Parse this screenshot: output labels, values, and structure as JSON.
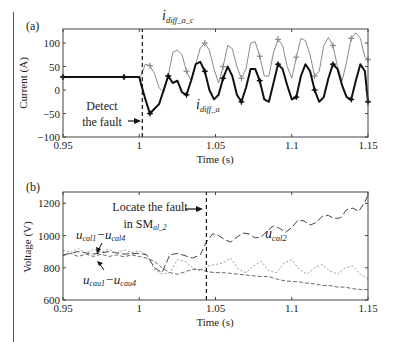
{
  "chart_data": [
    {
      "type": "line",
      "panel_label": "(a)",
      "title": "",
      "xlabel": "Time (s)",
      "ylabel": "Current (A)",
      "xlim": [
        0.95,
        1.15
      ],
      "ylim": [
        -100,
        130
      ],
      "xticks": [
        0.95,
        1,
        1.05,
        1.1,
        1.15
      ],
      "xtick_labels": [
        "0.95",
        "1",
        "1.05",
        "1.1",
        "1.15"
      ],
      "yticks": [
        -100,
        -50,
        0,
        50,
        100
      ],
      "ytick_labels": [
        "−100",
        "−50",
        "0",
        "50",
        "100"
      ],
      "grid": false,
      "vline": {
        "x": 1.002,
        "style": "dashed"
      },
      "annotations": [
        {
          "text": "Detect",
          "x": 0.965,
          "y": -30
        },
        {
          "text": "the fault",
          "x": 0.965,
          "y": -62,
          "arrow_to": [
            1.001,
            -55
          ]
        },
        {
          "text": "i",
          "sub": "diff_a_c",
          "x": 1.026,
          "y": 105
        },
        {
          "text": "i",
          "sub": "diff_a",
          "x": 1.045,
          "y": -72
        }
      ],
      "series": [
        {
          "name": "i_diff_a_c",
          "color": "#8a8a8a",
          "marker": "+",
          "x": [
            0.95,
            0.96,
            0.97,
            0.98,
            0.99,
            1.0,
            1.001,
            1.004,
            1.007,
            1.01,
            1.013,
            1.016,
            1.019,
            1.022,
            1.025,
            1.028,
            1.031,
            1.034,
            1.037,
            1.04,
            1.043,
            1.046,
            1.049,
            1.052,
            1.055,
            1.058,
            1.061,
            1.064,
            1.067,
            1.07,
            1.073,
            1.076,
            1.079,
            1.082,
            1.085,
            1.088,
            1.091,
            1.094,
            1.097,
            1.1,
            1.103,
            1.106,
            1.109,
            1.112,
            1.115,
            1.118,
            1.121,
            1.124,
            1.127,
            1.13,
            1.133,
            1.136,
            1.139,
            1.142,
            1.145,
            1.148,
            1.15
          ],
          "y": [
            28,
            28,
            28,
            28,
            28,
            28,
            30,
            55,
            52,
            35,
            5,
            -5,
            30,
            80,
            85,
            75,
            40,
            20,
            55,
            90,
            100,
            85,
            45,
            15,
            50,
            95,
            88,
            50,
            25,
            45,
            100,
            103,
            72,
            30,
            30,
            80,
            108,
            95,
            50,
            25,
            70,
            110,
            105,
            75,
            30,
            40,
            95,
            112,
            95,
            50,
            20,
            60,
            110,
            122,
            110,
            70,
            65
          ]
        },
        {
          "name": "i_diff_a",
          "color": "#111111",
          "marker": "*",
          "x": [
            0.95,
            0.96,
            0.97,
            0.98,
            0.99,
            1.0,
            1.001,
            1.004,
            1.007,
            1.01,
            1.013,
            1.016,
            1.019,
            1.022,
            1.025,
            1.028,
            1.031,
            1.034,
            1.037,
            1.04,
            1.043,
            1.046,
            1.049,
            1.052,
            1.055,
            1.058,
            1.061,
            1.064,
            1.067,
            1.07,
            1.073,
            1.076,
            1.079,
            1.082,
            1.085,
            1.088,
            1.091,
            1.094,
            1.097,
            1.1,
            1.103,
            1.106,
            1.109,
            1.112,
            1.115,
            1.118,
            1.121,
            1.124,
            1.127,
            1.13,
            1.133,
            1.136,
            1.139,
            1.142,
            1.145,
            1.148,
            1.15
          ],
          "y": [
            28,
            28,
            28,
            28,
            28,
            28,
            15,
            -20,
            -50,
            -40,
            -30,
            0,
            30,
            15,
            20,
            -5,
            -10,
            20,
            55,
            60,
            40,
            0,
            -20,
            -10,
            25,
            50,
            30,
            -10,
            -25,
            5,
            45,
            45,
            20,
            -20,
            -25,
            15,
            55,
            45,
            10,
            -20,
            -15,
            30,
            55,
            40,
            0,
            -25,
            -15,
            25,
            55,
            45,
            10,
            -15,
            -20,
            20,
            55,
            40,
            -25
          ]
        },
        {
          "name": "dashed_fault_line",
          "color": "#111111",
          "x": [
            1.002,
            1.002
          ],
          "y": [
            -100,
            130
          ]
        }
      ]
    },
    {
      "type": "line",
      "panel_label": "(b)",
      "title": "",
      "xlabel": "Time (s)",
      "ylabel": "Voltage (V)",
      "xlim": [
        0.95,
        1.15
      ],
      "ylim": [
        600,
        1270
      ],
      "xticks": [
        0.95,
        1,
        1.05,
        1.1,
        1.15
      ],
      "xtick_labels": [
        "0.95",
        "1",
        "1.05",
        "1.1",
        "1.15"
      ],
      "yticks": [
        600,
        800,
        1000,
        1200
      ],
      "ytick_labels": [
        "600",
        "800",
        "1000",
        "1200"
      ],
      "grid": false,
      "vline": {
        "x": 1.044,
        "style": "dashed"
      },
      "annotations": [
        {
          "text": "Locate the fault",
          "x": 0.99,
          "y": 1200
        },
        {
          "text": "in SM",
          "sub": "al_2",
          "x": 1.0,
          "y": 1120,
          "arrow_to": [
            1.043,
            1175
          ]
        },
        {
          "text": "u",
          "sub": "cal1",
          "text2": "−u",
          "sub2": "cal4",
          "x": 0.957,
          "y": 970,
          "arrow_to": [
            0.975,
            920
          ]
        },
        {
          "text": "u",
          "sub": "cau1",
          "text2": "−u",
          "sub2": "cau4",
          "x": 0.962,
          "y": 735,
          "arrow_to": [
            0.973,
            860
          ]
        },
        {
          "text": "u",
          "sub": "cal2",
          "x": 1.09,
          "y": 1140
        }
      ],
      "series": [
        {
          "name": "u_cal2",
          "color": "#444444",
          "style": "dashdot",
          "x": [
            0.95,
            0.96,
            0.97,
            0.98,
            0.99,
            1.0,
            1.005,
            1.01,
            1.015,
            1.02,
            1.025,
            1.03,
            1.035,
            1.04,
            1.044,
            1.048,
            1.052,
            1.056,
            1.06,
            1.064,
            1.068,
            1.072,
            1.076,
            1.08,
            1.084,
            1.088,
            1.092,
            1.096,
            1.1,
            1.104,
            1.108,
            1.112,
            1.116,
            1.12,
            1.124,
            1.128,
            1.132,
            1.136,
            1.14,
            1.144,
            1.148,
            1.15
          ],
          "y": [
            880,
            900,
            885,
            900,
            885,
            890,
            880,
            800,
            770,
            880,
            890,
            875,
            860,
            880,
            960,
            1010,
            1000,
            975,
            960,
            990,
            1015,
            1010,
            985,
            990,
            1030,
            1060,
            1045,
            1020,
            1050,
            1095,
            1090,
            1065,
            1080,
            1120,
            1125,
            1105,
            1110,
            1160,
            1170,
            1150,
            1210,
            1250
          ]
        },
        {
          "name": "u_cal1-u_cal4",
          "color": "#9a9a9a",
          "style": "dotted",
          "x": [
            0.95,
            0.955,
            0.96,
            0.965,
            0.97,
            0.975,
            0.98,
            0.985,
            0.99,
            0.995,
            1.0,
            1.005,
            1.01,
            1.015,
            1.02,
            1.025,
            1.03,
            1.035,
            1.04,
            1.045,
            1.05,
            1.055,
            1.06,
            1.065,
            1.07,
            1.075,
            1.08,
            1.085,
            1.09,
            1.095,
            1.1,
            1.105,
            1.11,
            1.115,
            1.12,
            1.125,
            1.13,
            1.135,
            1.14,
            1.145,
            1.15
          ],
          "y": [
            910,
            895,
            920,
            890,
            915,
            895,
            915,
            890,
            910,
            895,
            905,
            880,
            790,
            760,
            770,
            850,
            840,
            800,
            780,
            810,
            820,
            830,
            860,
            790,
            770,
            810,
            840,
            780,
            770,
            830,
            850,
            790,
            760,
            800,
            820,
            780,
            760,
            800,
            810,
            760,
            730
          ]
        },
        {
          "name": "u_cau1-u_cau4",
          "color": "#6a6a6a",
          "style": "dashed",
          "x": [
            0.95,
            0.955,
            0.96,
            0.965,
            0.97,
            0.975,
            0.98,
            0.985,
            0.99,
            0.995,
            1.0,
            1.005,
            1.01,
            1.015,
            1.02,
            1.025,
            1.03,
            1.035,
            1.04,
            1.045,
            1.05,
            1.055,
            1.06,
            1.065,
            1.07,
            1.075,
            1.08,
            1.085,
            1.09,
            1.095,
            1.1,
            1.105,
            1.11,
            1.115,
            1.12,
            1.125,
            1.13,
            1.135,
            1.14,
            1.145,
            1.15
          ],
          "y": [
            875,
            890,
            870,
            885,
            870,
            885,
            870,
            880,
            868,
            880,
            870,
            860,
            840,
            800,
            770,
            760,
            775,
            790,
            790,
            775,
            770,
            770,
            765,
            760,
            755,
            750,
            745,
            745,
            730,
            720,
            715,
            712,
            705,
            700,
            690,
            690,
            680,
            680,
            670,
            665,
            665
          ]
        },
        {
          "name": "dashed_fault_line",
          "color": "#111111",
          "x": [
            1.044,
            1.044
          ],
          "y": [
            600,
            1270
          ]
        }
      ]
    }
  ],
  "labels": {
    "panel_a": "(a)",
    "panel_b": "(b)",
    "a_xlabel": "Time (s)",
    "a_ylabel": "Current (A)",
    "b_xlabel": "Time (s)",
    "b_ylabel": "Voltage (V)",
    "a_detect_1": "Detect",
    "a_detect_2": "the fault",
    "a_series_c_main": "i",
    "a_series_c_sub": "diff_a_c",
    "a_series_a_main": "i",
    "a_series_a_sub": "diff_a",
    "b_locate_1": "Locate the fault",
    "b_locate_2_main": "in SM",
    "b_locate_2_sub": "al_2",
    "b_ucal_1": "u",
    "b_ucal_1_sub": "cal1",
    "b_ucal_2": "−u",
    "b_ucal_2_sub": "cal4",
    "b_ucau_1": "u",
    "b_ucau_1_sub": "cau1",
    "b_ucau_2": "−u",
    "b_ucau_2_sub": "cau4",
    "b_ucal2": "u",
    "b_ucal2_sub": "cal2"
  }
}
